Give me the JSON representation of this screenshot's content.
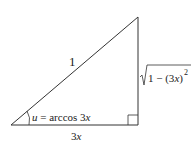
{
  "diagram": {
    "type": "right-triangle",
    "hypotenuse_label": "1",
    "adjacent_label_coef": "3",
    "adjacent_label_var": "x",
    "opposite_label": {
      "prefix": "1 − (3",
      "var": "x",
      "suffix": ")",
      "exponent": "2"
    },
    "angle_label": {
      "var": "u",
      "text": " = arccos 3",
      "var2": "x"
    },
    "line_color": "#333333"
  }
}
